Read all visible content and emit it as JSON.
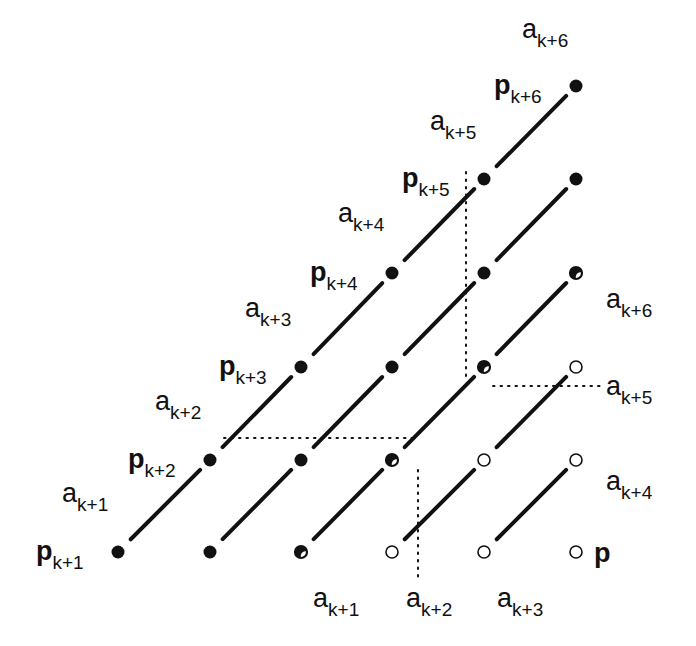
{
  "diagram": {
    "type": "lattice-diagram",
    "colors": {
      "ink": "#111111",
      "background": "#ffffff"
    },
    "grid": {
      "columns_x": [
        118,
        210,
        301,
        392,
        484,
        576
      ],
      "rows_y": [
        552,
        460,
        367,
        273,
        179,
        86
      ]
    },
    "points": [
      {
        "col": 0,
        "row": 0,
        "style": "filled"
      },
      {
        "col": 1,
        "row": 0,
        "style": "filled"
      },
      {
        "col": 2,
        "row": 0,
        "style": "half"
      },
      {
        "col": 3,
        "row": 0,
        "style": "open"
      },
      {
        "col": 4,
        "row": 0,
        "style": "open"
      },
      {
        "col": 5,
        "row": 0,
        "style": "open"
      },
      {
        "col": 1,
        "row": 1,
        "style": "filled"
      },
      {
        "col": 2,
        "row": 1,
        "style": "filled"
      },
      {
        "col": 3,
        "row": 1,
        "style": "half"
      },
      {
        "col": 4,
        "row": 1,
        "style": "open"
      },
      {
        "col": 5,
        "row": 1,
        "style": "open"
      },
      {
        "col": 2,
        "row": 2,
        "style": "filled"
      },
      {
        "col": 3,
        "row": 2,
        "style": "filled"
      },
      {
        "col": 4,
        "row": 2,
        "style": "half"
      },
      {
        "col": 5,
        "row": 2,
        "style": "open"
      },
      {
        "col": 3,
        "row": 3,
        "style": "filled"
      },
      {
        "col": 4,
        "row": 3,
        "style": "filled"
      },
      {
        "col": 5,
        "row": 3,
        "style": "half"
      },
      {
        "col": 4,
        "row": 4,
        "style": "filled"
      },
      {
        "col": 5,
        "row": 4,
        "style": "filled"
      },
      {
        "col": 5,
        "row": 5,
        "style": "filled"
      }
    ],
    "segments": [
      {
        "from": [
          0,
          0
        ],
        "to": [
          1,
          1
        ]
      },
      {
        "from": [
          1,
          1
        ],
        "to": [
          2,
          2
        ]
      },
      {
        "from": [
          2,
          2
        ],
        "to": [
          3,
          3
        ]
      },
      {
        "from": [
          3,
          3
        ],
        "to": [
          4,
          4
        ]
      },
      {
        "from": [
          4,
          4
        ],
        "to": [
          5,
          5
        ]
      },
      {
        "from": [
          1,
          0
        ],
        "to": [
          2,
          1
        ]
      },
      {
        "from": [
          2,
          1
        ],
        "to": [
          3,
          2
        ]
      },
      {
        "from": [
          3,
          2
        ],
        "to": [
          4,
          3
        ]
      },
      {
        "from": [
          4,
          3
        ],
        "to": [
          5,
          4
        ]
      },
      {
        "from": [
          2,
          0
        ],
        "to": [
          3,
          1
        ]
      },
      {
        "from": [
          3,
          1
        ],
        "to": [
          4,
          2
        ]
      },
      {
        "from": [
          4,
          2
        ],
        "to": [
          5,
          3
        ]
      },
      {
        "from": [
          3,
          0
        ],
        "to": [
          4,
          1
        ]
      },
      {
        "from": [
          4,
          1
        ],
        "to": [
          5,
          2
        ]
      },
      {
        "from": [
          4,
          0
        ],
        "to": [
          5,
          1
        ]
      }
    ],
    "dotted_lines": [
      {
        "x1": 224,
        "y1": 438,
        "x2": 412,
        "y2": 438
      },
      {
        "x1": 466,
        "y1": 172,
        "x2": 466,
        "y2": 380
      },
      {
        "x1": 493,
        "y1": 386,
        "x2": 600,
        "y2": 386
      },
      {
        "x1": 418,
        "y1": 470,
        "x2": 418,
        "y2": 580
      }
    ],
    "labels": {
      "diagonal_p": [
        {
          "base": "p",
          "sub": "k+1",
          "x": 36,
          "y": 538
        },
        {
          "base": "p",
          "sub": "k+2",
          "x": 128,
          "y": 446
        },
        {
          "base": "p",
          "sub": "k+3",
          "x": 219,
          "y": 353
        },
        {
          "base": "p",
          "sub": "k+4",
          "x": 310,
          "y": 259
        },
        {
          "base": "p",
          "sub": "k+5",
          "x": 402,
          "y": 165
        },
        {
          "base": "p",
          "sub": "k+6",
          "x": 494,
          "y": 72
        }
      ],
      "diagonal_a": [
        {
          "base": "a",
          "sub": "k+1",
          "x": 62,
          "y": 480
        },
        {
          "base": "a",
          "sub": "k+2",
          "x": 155,
          "y": 388
        },
        {
          "base": "a",
          "sub": "k+3",
          "x": 245,
          "y": 295
        },
        {
          "base": "a",
          "sub": "k+4",
          "x": 338,
          "y": 200
        },
        {
          "base": "a",
          "sub": "k+5",
          "x": 430,
          "y": 108
        },
        {
          "base": "a",
          "sub": "k+6",
          "x": 522,
          "y": 16
        }
      ],
      "bottom_a": [
        {
          "base": "a",
          "sub": "k+1",
          "x": 313,
          "y": 585
        },
        {
          "base": "a",
          "sub": "k+2",
          "x": 406,
          "y": 585
        },
        {
          "base": "a",
          "sub": "k+3",
          "x": 497,
          "y": 585
        }
      ],
      "right_a": [
        {
          "base": "a",
          "sub": "k+6",
          "x": 606,
          "y": 286
        },
        {
          "base": "a",
          "sub": "k+5",
          "x": 606,
          "y": 373
        },
        {
          "base": "a",
          "sub": "k+4",
          "x": 606,
          "y": 468
        }
      ],
      "corner_p": {
        "base": "p",
        "x": 594,
        "y": 540
      }
    }
  }
}
